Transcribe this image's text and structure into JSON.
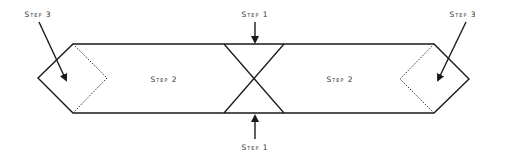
{
  "diagram": {
    "type": "folding-instructions",
    "colors": {
      "line": "#1a1a1a",
      "dotted": "#333333",
      "text": "#333333",
      "background": "#ffffff"
    },
    "labels": {
      "step1_top": "Step 1",
      "step1_bottom": "Step 1",
      "step2_left": "Step 2",
      "step2_right": "Step 2",
      "step3_left": "Step 3",
      "step3_right": "Step 3"
    }
  }
}
